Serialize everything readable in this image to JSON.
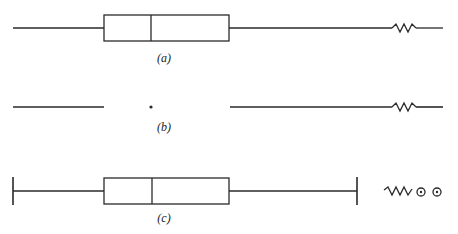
{
  "figure": {
    "colors": {
      "ink": "#2a2a2a",
      "background": "#ffffff"
    },
    "panels": [
      {
        "id": "a",
        "label": "(a)",
        "elements": [
          "left-whisker-line",
          "box",
          "median-line",
          "right-whisker-line",
          "axis-break-zigzag"
        ]
      },
      {
        "id": "b",
        "label": "(b)",
        "elements": [
          "left-line-segment",
          "median-dot",
          "right-line-segment",
          "axis-break-zigzag"
        ]
      },
      {
        "id": "c",
        "label": "(c)",
        "elements": [
          "left-whisker-cap",
          "left-whisker-line",
          "box",
          "median-line",
          "right-whisker-line",
          "right-whisker-cap",
          "axis-break-zigzag",
          "outlier-circle",
          "outlier-circle"
        ]
      }
    ]
  }
}
